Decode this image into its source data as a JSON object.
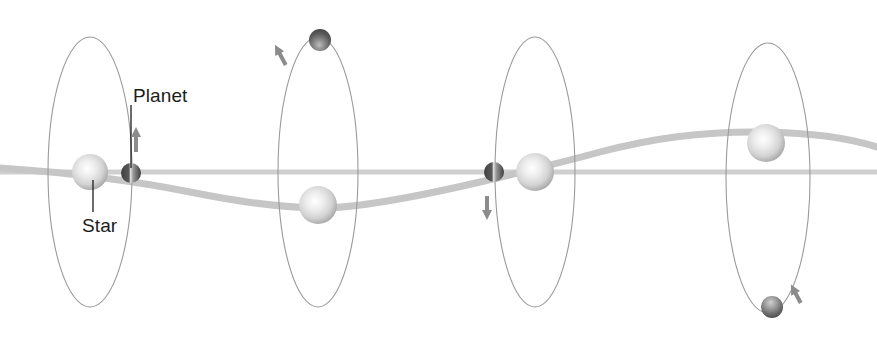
{
  "diagram": {
    "background_color": "#ffffff",
    "labels": [
      {
        "id": "planet",
        "text": "Planet",
        "x": 133,
        "y": 86
      },
      {
        "id": "star",
        "text": "Star",
        "x": 82,
        "y": 216
      }
    ],
    "leader_lines": [
      {
        "id": "planet-leader",
        "from_x": 131,
        "from_y": 105,
        "to_x": 131,
        "to_y": 168,
        "color": "#1c1c1c"
      },
      {
        "id": "star-leader",
        "from_x": 93,
        "from_y": 212,
        "to_x": 93,
        "to_y": 180,
        "color": "#1c1c1c"
      }
    ],
    "baseline": {
      "id": "reference-line",
      "y": 172,
      "x_start": 0,
      "x_end": 877,
      "color": "#cfcfcf",
      "thickness": 5
    },
    "wobble_curve": {
      "id": "radial-velocity-curve",
      "color": "#c6c6c6",
      "thickness": 7,
      "description": "sinusoidal path traced by the star as it orbits the common centre of mass",
      "path": "M 0 168 C 60 172, 120 178, 190 192 C 255 205, 290 208, 320 208 C 360 208, 420 196, 480 182 C 530 170, 560 163, 600 152 C 650 139, 700 131, 765 132 C 820 133, 855 140, 877 147"
    },
    "orbits": [
      {
        "id": "orbit-1",
        "cx": 90,
        "cy": 172,
        "rx": 42,
        "ry": 135,
        "stroke": "#9a9a9a",
        "star": {
          "cx": 90,
          "cy": 172,
          "r": 18,
          "type": "star"
        },
        "planet": {
          "cx": 131,
          "cy": 173,
          "r": 10,
          "type": "planet-edge-on",
          "phase": "right-limb-approaching"
        },
        "motion_arrow": {
          "id": "motion-arrow-up",
          "x": 136,
          "y": 130,
          "direction": "up"
        }
      },
      {
        "id": "orbit-2",
        "cx": 318,
        "cy": 172,
        "rx": 40,
        "ry": 135,
        "stroke": "#9a9a9a",
        "star": {
          "cx": 318,
          "cy": 205,
          "r": 19,
          "type": "star"
        },
        "planet": {
          "cx": 320,
          "cy": 40,
          "r": 11,
          "type": "planet-far-side",
          "phase": "top-of-orbit"
        },
        "motion_arrow": {
          "id": "motion-arrow-diag-left",
          "x": 282,
          "y": 52,
          "direction": "diagonal-left"
        }
      },
      {
        "id": "orbit-3",
        "cx": 535,
        "cy": 172,
        "rx": 40,
        "ry": 135,
        "stroke": "#9a9a9a",
        "star": {
          "cx": 535,
          "cy": 172,
          "r": 19,
          "type": "star"
        },
        "planet": {
          "cx": 494,
          "cy": 172,
          "r": 10,
          "type": "planet-edge-on",
          "phase": "left-limb-receding"
        },
        "motion_arrow": {
          "id": "motion-arrow-down",
          "x": 487,
          "y": 198,
          "direction": "down"
        }
      },
      {
        "id": "orbit-4",
        "cx": 768,
        "cy": 178,
        "rx": 42,
        "ry": 135,
        "stroke": "#9a9a9a",
        "star": {
          "cx": 766,
          "cy": 143,
          "r": 19,
          "type": "star"
        },
        "planet": {
          "cx": 772,
          "cy": 307,
          "r": 11,
          "type": "planet-near-side",
          "phase": "bottom-of-orbit"
        },
        "motion_arrow": {
          "id": "motion-arrow-diag-right",
          "x": 797,
          "y": 290,
          "direction": "diagonal-right"
        }
      }
    ],
    "colors": {
      "star_core": "#ffffff",
      "star_mid": "#dcdcdc",
      "star_edge": "#a9a9a9",
      "planet_light": "#d8d8d8",
      "planet_dark": "#4a4a4a",
      "orbit_stroke": "#9a9a9a",
      "curve": "#c6c6c6",
      "baseline": "#cfcfcf",
      "label_text": "#1c1c1c",
      "arrow": "#8c8c8c"
    }
  }
}
